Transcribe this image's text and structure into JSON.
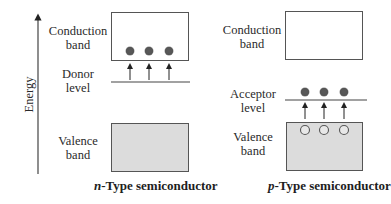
{
  "axis": {
    "label": "Energy"
  },
  "n_type": {
    "caption_prefix": "n",
    "caption_rest": "-Type semiconductor",
    "conduction_label_1": "Conduction",
    "conduction_label_2": "band",
    "level_label_1": "Donor",
    "level_label_2": "level",
    "valence_label_1": "Valence",
    "valence_label_2": "band",
    "electrons": 3
  },
  "p_type": {
    "caption_prefix": "p",
    "caption_rest": "-Type semiconductor",
    "conduction_label_1": "Conduction",
    "conduction_label_2": "band",
    "level_label_1": "Acceptor",
    "level_label_2": "level",
    "valence_label_1": "Valence",
    "valence_label_2": "band",
    "electrons": 3,
    "holes": 3
  },
  "colors": {
    "valence_fill": "#dcdcdc",
    "electron": "#555555",
    "line": "#444444"
  }
}
